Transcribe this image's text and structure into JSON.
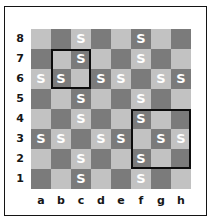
{
  "figure": {
    "type": "chessboard-diagram",
    "caption": ""
  },
  "board": {
    "files": [
      "a",
      "b",
      "c",
      "d",
      "e",
      "f",
      "g",
      "h"
    ],
    "ranks": [
      "8",
      "7",
      "6",
      "5",
      "4",
      "3",
      "2",
      "1"
    ],
    "light_color": "#c2c2c2",
    "dark_color": "#7b7b7b",
    "mark_color": "#ffffff",
    "mark_glyph": "S",
    "cell_size": 20,
    "marked_squares": [
      "c8",
      "f8",
      "c7",
      "f7",
      "a6",
      "b6",
      "d6",
      "e6",
      "g6",
      "h6",
      "c5",
      "f5",
      "c4",
      "f4",
      "a3",
      "b3",
      "d3",
      "e3",
      "g3",
      "h3",
      "c2",
      "f2",
      "c1",
      "f1"
    ],
    "highlights": [
      {
        "name": "highlight-box-b7c6",
        "file_start": "b",
        "rank_start": "7",
        "files": 2,
        "ranks": 2,
        "color": "#0d0d0d"
      },
      {
        "name": "highlight-box-f4h2",
        "file_start": "f",
        "rank_start": "4",
        "files": 3,
        "ranks": 3,
        "color": "#0d0d0d"
      }
    ]
  },
  "chart_data": {
    "type": "heatmap",
    "title": "",
    "xlabel": "",
    "ylabel": "",
    "categories": [
      "a",
      "b",
      "c",
      "d",
      "e",
      "f",
      "g",
      "h"
    ],
    "rows": [
      "8",
      "7",
      "6",
      "5",
      "4",
      "3",
      "2",
      "1"
    ],
    "legend": [],
    "grid": true,
    "series": [
      {
        "name": "8",
        "values": [
          0,
          0,
          1,
          0,
          0,
          1,
          0,
          0
        ]
      },
      {
        "name": "7",
        "values": [
          0,
          0,
          1,
          0,
          0,
          1,
          0,
          0
        ]
      },
      {
        "name": "6",
        "values": [
          1,
          1,
          0,
          1,
          1,
          0,
          1,
          1
        ]
      },
      {
        "name": "5",
        "values": [
          0,
          0,
          1,
          0,
          0,
          1,
          0,
          0
        ]
      },
      {
        "name": "4",
        "values": [
          0,
          0,
          1,
          0,
          0,
          1,
          0,
          0
        ]
      },
      {
        "name": "3",
        "values": [
          1,
          1,
          0,
          1,
          1,
          0,
          1,
          1
        ]
      },
      {
        "name": "2",
        "values": [
          0,
          0,
          1,
          0,
          0,
          1,
          0,
          0
        ]
      },
      {
        "name": "1",
        "values": [
          0,
          0,
          1,
          0,
          0,
          1,
          0,
          0
        ]
      }
    ]
  }
}
